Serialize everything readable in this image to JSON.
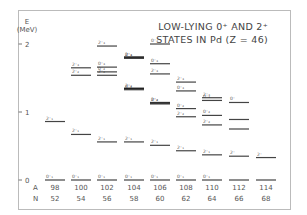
{
  "chart_data": {
    "type": "level-scheme",
    "title": [
      "LOW-LYING 0⁺ AND 2⁺",
      "STATES IN Pd (Z = 46)"
    ],
    "ylabel": "E",
    "yunit": "(MeV)",
    "yticks": [
      {
        "label": "0",
        "value": 0
      },
      {
        "label": "1",
        "value": 1
      },
      {
        "label": "2",
        "value": 2
      }
    ],
    "ylim": [
      0,
      2.2
    ],
    "row_labels": {
      "A": "A",
      "N": "N"
    },
    "columns": [
      {
        "A": "98",
        "N": "52",
        "levels": [
          {
            "label": "0⁺₁",
            "E": 0
          },
          {
            "label": "2⁺₁",
            "E": 0.86
          }
        ]
      },
      {
        "A": "100",
        "N": "54",
        "levels": [
          {
            "label": "0⁺₁",
            "E": 0
          },
          {
            "label": "2⁺₁",
            "E": 0.67
          },
          {
            "label": "2⁺₂",
            "E": 1.54
          },
          {
            "label": "2⁺₃",
            "E": 1.65
          }
        ]
      },
      {
        "A": "102",
        "N": "56",
        "levels": [
          {
            "label": "0⁺₁",
            "E": 0
          },
          {
            "label": "2⁺₁",
            "E": 0.56
          },
          {
            "label": "2⁺₂",
            "E": 1.54
          },
          {
            "label": "0⁺₂",
            "E": 1.59
          },
          {
            "label": "0⁺₃",
            "E": 1.66
          },
          {
            "label": "2⁺₃",
            "E": 1.97
          }
        ]
      },
      {
        "A": "104",
        "N": "58",
        "levels": [
          {
            "label": "0⁺₁",
            "E": 0
          },
          {
            "label": "2⁺₁",
            "E": 0.56
          },
          {
            "label": "2⁺₂",
            "E": 1.34,
            "thick": true
          },
          {
            "label": "0⁺₂",
            "E": 1.33
          },
          {
            "label": "2⁺₃",
            "E": 1.8,
            "thick": true
          },
          {
            "label": "0⁺₃",
            "E": 1.79
          }
        ]
      },
      {
        "A": "106",
        "N": "60",
        "levels": [
          {
            "label": "0⁺₁",
            "E": 0
          },
          {
            "label": "2⁺₁",
            "E": 0.51
          },
          {
            "label": "2⁺₂",
            "E": 1.13,
            "thick": true
          },
          {
            "label": "0⁺₂",
            "E": 1.13
          },
          {
            "label": "2⁺₃",
            "E": 1.56
          },
          {
            "label": "0⁺₃",
            "E": 1.71
          },
          {
            "label": "0⁺₄",
            "E": 2.0
          }
        ]
      },
      {
        "A": "108",
        "N": "62",
        "levels": [
          {
            "label": "0⁺₁",
            "E": 0
          },
          {
            "label": "2⁺₁",
            "E": 0.43
          },
          {
            "label": "2⁺₂",
            "E": 0.93
          },
          {
            "label": "0⁺₂",
            "E": 1.05
          },
          {
            "label": "0⁺₃",
            "E": 1.31
          },
          {
            "label": "2⁺₃",
            "E": 1.44
          }
        ]
      },
      {
        "A": "110",
        "N": "64",
        "levels": [
          {
            "label": "0⁺₁",
            "E": 0
          },
          {
            "label": "2⁺₁",
            "E": 0.37
          },
          {
            "label": "2⁺₂",
            "E": 0.81
          },
          {
            "label": "0⁺₂",
            "E": 0.95
          },
          {
            "label": "0⁺₃",
            "E": 1.17
          },
          {
            "label": "2⁺₃",
            "E": 1.21
          }
        ]
      },
      {
        "A": "112",
        "N": "66",
        "levels": [
          {
            "label": "",
            "E": 0
          },
          {
            "label": "2⁺",
            "E": 0.35
          },
          {
            "label": "",
            "E": 0.75
          },
          {
            "label": "",
            "E": 0.89
          },
          {
            "label": "0⁺",
            "E": 1.14
          }
        ]
      },
      {
        "A": "114",
        "N": "68",
        "levels": [
          {
            "label": "",
            "E": 0
          },
          {
            "label": "2⁺",
            "E": 0.33
          }
        ]
      }
    ]
  }
}
